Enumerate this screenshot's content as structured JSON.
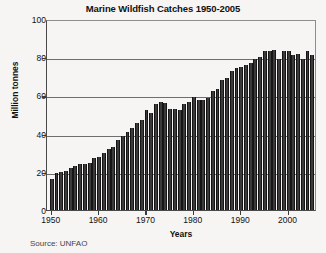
{
  "chart_data": {
    "type": "bar",
    "title": "Marine Wildfish Catches 1950-2005",
    "xlabel": "Years",
    "ylabel": "Million tonnes",
    "source": "Source: UNFAO",
    "xlim": [
      1949,
      2006
    ],
    "ylim": [
      0,
      100
    ],
    "grid": true,
    "legend": "none",
    "yticks": [
      0,
      20,
      40,
      60,
      80,
      100
    ],
    "ytick_labels": [
      "0",
      "20",
      "40",
      "60",
      "80",
      "100"
    ],
    "xticks": [
      1950,
      1960,
      1970,
      1980,
      1990,
      2000
    ],
    "xtick_labels": [
      "1950",
      "1960",
      "1970",
      "1980",
      "1990",
      "2000"
    ],
    "bar_color": "#3b3b3b",
    "categories": [
      1950,
      1951,
      1952,
      1953,
      1954,
      1955,
      1956,
      1957,
      1958,
      1959,
      1960,
      1961,
      1962,
      1963,
      1964,
      1965,
      1966,
      1967,
      1968,
      1969,
      1970,
      1971,
      1972,
      1973,
      1974,
      1975,
      1976,
      1977,
      1978,
      1979,
      1980,
      1981,
      1982,
      1983,
      1984,
      1985,
      1986,
      1987,
      1988,
      1989,
      1990,
      1991,
      1992,
      1993,
      1994,
      1995,
      1996,
      1997,
      1998,
      1999,
      2000,
      2001,
      2002,
      2003,
      2004,
      2005
    ],
    "values": [
      16.5,
      19.5,
      20.0,
      20.5,
      22.0,
      23.0,
      24.0,
      24.0,
      24.5,
      27.0,
      28.0,
      30.0,
      32.0,
      33.0,
      36.5,
      38.5,
      41.0,
      43.0,
      45.5,
      47.0,
      52.5,
      51.0,
      55.5,
      56.5,
      56.0,
      53.0,
      53.0,
      52.5,
      55.5,
      56.5,
      59.0,
      57.5,
      57.5,
      58.5,
      62.5,
      63.5,
      68.0,
      69.0,
      73.0,
      74.5,
      75.0,
      76.0,
      77.0,
      79.0,
      80.0,
      83.5,
      83.0,
      84.0,
      79.0,
      83.5,
      83.0,
      81.0,
      81.5,
      79.0,
      83.0,
      81.0
    ]
  }
}
